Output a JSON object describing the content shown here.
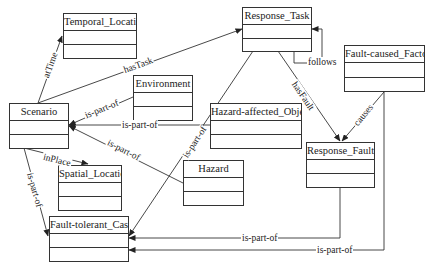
{
  "diagram": {
    "type": "uml-class-diagram",
    "classes": [
      {
        "id": "temporal_location",
        "name": "Temporal_Location"
      },
      {
        "id": "response_task",
        "name": "Response_Task"
      },
      {
        "id": "fault_caused_factor",
        "name": "Fault-caused_Factor"
      },
      {
        "id": "environment",
        "name": "Environment"
      },
      {
        "id": "scenario",
        "name": "Scenario"
      },
      {
        "id": "hazard_affected_object",
        "name": "Hazard-affected_Object"
      },
      {
        "id": "response_fault",
        "name": "Response_Fault"
      },
      {
        "id": "spatial_location",
        "name": "Spatial_Location"
      },
      {
        "id": "hazard",
        "name": "Hazard"
      },
      {
        "id": "fault_tolerant_case",
        "name": "Fault-tolerant_Case"
      }
    ],
    "relations": [
      {
        "from": "Scenario",
        "to": "Temporal_Location",
        "label": "atTime"
      },
      {
        "from": "Scenario",
        "to": "Response_Task",
        "label": "hasTask"
      },
      {
        "from": "Environment",
        "to": "Scenario",
        "label": "is-part-of"
      },
      {
        "from": "Hazard-affected_Object",
        "to": "Scenario",
        "label": "is-part-of"
      },
      {
        "from": "Hazard",
        "to": "Scenario",
        "label": "is-part-of"
      },
      {
        "from": "Scenario",
        "to": "Spatial_Location",
        "label": "inPlace"
      },
      {
        "from": "Scenario",
        "to": "Fault-tolerant_Case",
        "label": "is-part-of"
      },
      {
        "from": "Response_Task",
        "to": "Fault-tolerant_Case",
        "label": "is-part-of"
      },
      {
        "from": "Response_Task",
        "to": "Response_Task",
        "label": "follows"
      },
      {
        "from": "Response_Task",
        "to": "Response_Fault",
        "label": "hasFault"
      },
      {
        "from": "Fault-caused_Factor",
        "to": "Response_Fault",
        "label": "causes"
      },
      {
        "from": "Response_Fault",
        "to": "Fault-tolerant_Case",
        "label": "is-part-of"
      },
      {
        "from": "Fault-caused_Factor",
        "to": "Fault-tolerant_Case",
        "label": "is-part-of"
      }
    ],
    "labels": {
      "atTime": "atTime",
      "hasTask": "hasTask",
      "env_part": "is-part-of",
      "hao_part": "is-part-of",
      "hazard_part": "is-part-of",
      "inPlace": "inPlace",
      "scen_part": "is-part-of",
      "task_part": "is-part-of",
      "follows": "follows",
      "hasFault": "hasFault",
      "causes": "causes",
      "fault_part": "is-part-of",
      "factor_part": "is-part-of"
    },
    "colors": {
      "line": "#333333",
      "text": "#222222",
      "background": "#ffffff"
    }
  }
}
